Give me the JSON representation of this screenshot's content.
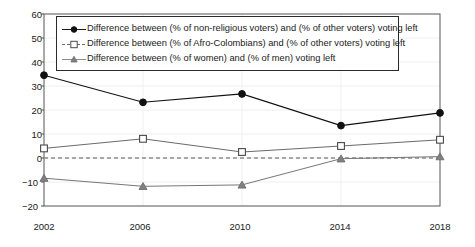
{
  "chart_data": {
    "type": "line",
    "title": "",
    "xlabel": "",
    "ylabel": "",
    "categories": [
      "2002",
      "2006",
      "2010",
      "2014",
      "2018"
    ],
    "x": [
      2002,
      2006,
      2010,
      2014,
      2018
    ],
    "xlim": [
      2002,
      2018
    ],
    "ylim": [
      -20,
      60
    ],
    "yticks": [
      -20,
      -10,
      0,
      10,
      20,
      30,
      40,
      50,
      60
    ],
    "ytick_labels": [
      "−20",
      "−10",
      "0",
      "10",
      "20",
      "30",
      "40",
      "50",
      "60"
    ],
    "xtick_labels": [
      "2002",
      "2006",
      "2010",
      "2014",
      "2018"
    ],
    "grid": "horizontal-light",
    "legend_position": "top-left-inside",
    "zero_reference_line": true,
    "series": [
      {
        "name": "Difference between (% of non-religious voters) and (% of other voters) voting left",
        "marker": "filled-circle",
        "color": "#111111",
        "values": [
          34.5,
          23.2,
          26.7,
          13.5,
          18.8
        ]
      },
      {
        "name": "Difference between (% of Afro-Colombians) and (% of other voters) voting left",
        "marker": "open-square",
        "color": "#6a6a6a",
        "values": [
          4.0,
          8.0,
          2.5,
          5.0,
          7.6
        ]
      },
      {
        "name": "Difference between (% of women) and (% of men) voting left",
        "marker": "filled-triangle",
        "color": "#777777",
        "values": [
          -8.4,
          -11.8,
          -11.2,
          -0.3,
          0.6
        ]
      }
    ]
  },
  "legend": {
    "items": [
      {
        "label": "Difference between (% of non-religious voters) and (% of other voters) voting left",
        "marker": "filled-circle"
      },
      {
        "label": "Difference between (% of Afro-Colombians) and (% of other voters) voting left",
        "marker": "open-square"
      },
      {
        "label": "Difference between (% of women) and (% of men) voting left",
        "marker": "filled-triangle"
      }
    ]
  },
  "axes": {
    "y_tick_labels": [
      "60",
      "50",
      "40",
      "30",
      "20",
      "10",
      "0",
      "−10",
      "−20"
    ],
    "x_tick_labels": [
      "2002",
      "2006",
      "2010",
      "2014",
      "2018"
    ]
  }
}
